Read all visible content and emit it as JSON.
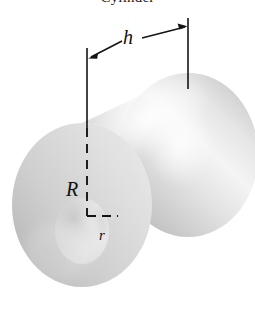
{
  "figure": {
    "title": "Cylinder",
    "background_color": "#ffffff",
    "line_color": "#141414",
    "labels": {
      "height": "h",
      "outer_radius": "R",
      "inner_radius": "r"
    },
    "shading": {
      "body_light": "#f2f2f2",
      "body_mid": "#d9d9d9",
      "body_dark": "#bdbdbd",
      "face_light": "#e9e9e9",
      "face_mid": "#cfcfcf",
      "face_dark": "#b4b4b4",
      "bore_light": "#fafafa",
      "bore_mid": "#dcdcdc"
    },
    "geometry": {
      "front_face_center": [
        82,
        205
      ],
      "front_outer_rx": 70,
      "front_outer_ry": 82,
      "front_inner_rx": 26,
      "front_inner_ry": 32,
      "back_face_center": [
        188,
        155
      ],
      "axis_angle_note": "cylinder axis runs from lower-left to upper-right"
    },
    "dimension_line": {
      "left_tick_x": 87,
      "left_tick_y1": 48,
      "left_tick_y2": 215,
      "right_tick_x": 188,
      "right_tick_y1": 18,
      "right_tick_y2": 88,
      "arrow_left_end": [
        89,
        58
      ],
      "arrow_right_end": [
        186,
        28
      ],
      "dash_start_y": 128
    }
  }
}
